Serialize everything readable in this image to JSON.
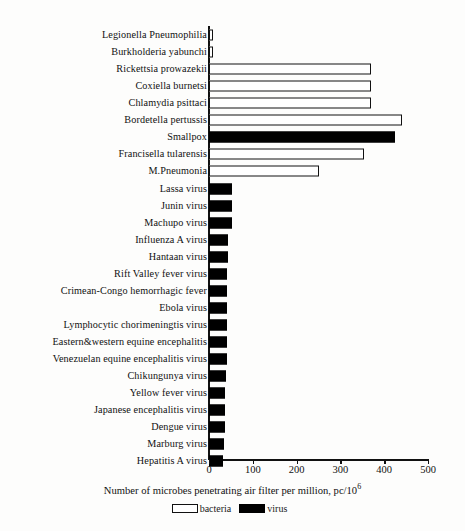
{
  "chart_data": {
    "type": "bar",
    "orientation": "horizontal",
    "title": "",
    "xlabel": "Number of microbes penetrating air filter per million, pc/10",
    "xlabel_superscript": "6",
    "ylabel": "",
    "xlim": [
      0,
      500
    ],
    "xticks": [
      0,
      100,
      200,
      300,
      400,
      500
    ],
    "xtick_labels": [
      "0",
      "100",
      "200",
      "300",
      "400",
      "500"
    ],
    "grid": false,
    "legend_position": "bottom",
    "legend": [
      {
        "label": "bacteria",
        "key": "bacteria",
        "color": "#ffffff"
      },
      {
        "label": "virus",
        "key": "virus",
        "color": "#000000"
      }
    ],
    "categories": [
      "Legionella Pneumophilia",
      "Burkholderia yabunchi",
      "Rickettsia prowazekii",
      "Coxiella burnetsi",
      "Chlamydia psittaci",
      "Bordetella pertussis",
      "Smallpox",
      "Francisella tularensis",
      "M.Pneumonia",
      "Lassa virus",
      "Junin virus",
      "Machupo virus",
      "Influenza A virus",
      "Hantaan virus",
      "Rift Valley fever virus",
      "Crimean-Congo hemorrhagic fever",
      "Ebola virus",
      "Lymphocytic chorimeningtis virus",
      "Eastern&western equine encephalitis",
      "Venezuelan equine encephalitis virus",
      "Chikungunya virus",
      "Yellow fever virus",
      "Japanese encephalitis virus",
      "Dengue virus",
      "Marburg virus",
      "Hepatitis A virus"
    ],
    "values": [
      10,
      10,
      370,
      370,
      370,
      440,
      425,
      355,
      250,
      52,
      52,
      52,
      44,
      43,
      42,
      42,
      41,
      41,
      40,
      40,
      39,
      36,
      36,
      36,
      35,
      33
    ],
    "groups": [
      "bacteria",
      "bacteria",
      "bacteria",
      "bacteria",
      "bacteria",
      "bacteria",
      "virus",
      "bacteria",
      "bacteria",
      "virus",
      "virus",
      "virus",
      "virus",
      "virus",
      "virus",
      "virus",
      "virus",
      "virus",
      "virus",
      "virus",
      "virus",
      "virus",
      "virus",
      "virus",
      "virus",
      "virus"
    ]
  }
}
